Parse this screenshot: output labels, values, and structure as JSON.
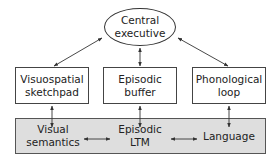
{
  "diagram": {
    "type": "working-memory-model",
    "top_node": {
      "line1": "Central",
      "line2": "executive"
    },
    "components": [
      {
        "line1": "Visuospatial",
        "line2": "sketchpad"
      },
      {
        "line1": "Episodic",
        "line2": "buffer"
      },
      {
        "line1": "Phonological",
        "line2": "loop"
      }
    ],
    "long_term_band": {
      "items": [
        {
          "line1": "Visual",
          "line2": "semantics"
        },
        {
          "line1": "Episodic",
          "line2": "LTM"
        },
        {
          "line1": "Language",
          "line2": ""
        }
      ],
      "fill_color": "#dedede"
    },
    "edges": [
      {
        "from": "Central executive",
        "to": "Visuospatial sketchpad",
        "type": "bidirectional"
      },
      {
        "from": "Central executive",
        "to": "Episodic buffer",
        "type": "bidirectional"
      },
      {
        "from": "Central executive",
        "to": "Phonological loop",
        "type": "bidirectional"
      },
      {
        "from": "Visuospatial sketchpad",
        "to": "Visual semantics",
        "type": "bidirectional"
      },
      {
        "from": "Episodic buffer",
        "to": "Episodic LTM",
        "type": "bidirectional"
      },
      {
        "from": "Phonological loop",
        "to": "Language",
        "type": "bidirectional"
      },
      {
        "from": "Visual semantics",
        "to": "Episodic LTM",
        "type": "bidirectional"
      },
      {
        "from": "Episodic LTM",
        "to": "Language",
        "type": "bidirectional"
      }
    ]
  }
}
